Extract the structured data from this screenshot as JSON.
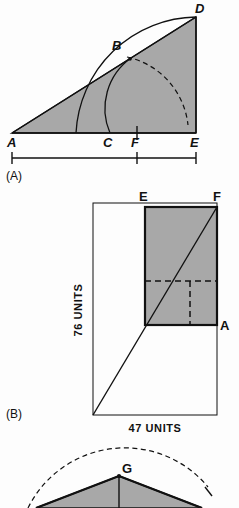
{
  "figure": {
    "panels": [
      {
        "id": "A",
        "panel_label": "(A)",
        "vertex_labels": {
          "a": "A",
          "b": "B",
          "c": "C",
          "d": "D",
          "e": "E",
          "f": "F"
        },
        "scalebar": {
          "present": true,
          "ticks": 3,
          "divisions": 2
        }
      },
      {
        "id": "B",
        "panel_label": "(B)",
        "vertex_labels": {
          "e": "E",
          "f": "F",
          "a": "A"
        },
        "width_label": "47 UNITS",
        "height_label": "76 UNITS"
      },
      {
        "id": "C",
        "panel_label": "",
        "vertex_labels": {
          "g": "G"
        }
      }
    ]
  },
  "colors": {
    "ink": "#111111",
    "shade": "#a8a8a8",
    "paper": "#fdfdfd"
  }
}
